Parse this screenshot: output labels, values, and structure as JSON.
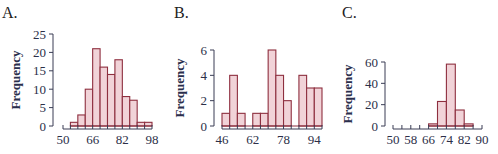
{
  "colors": {
    "bar_fill": "#f1d3d8",
    "bar_stroke": "#8e2f3f",
    "axis": "#3a3d55",
    "tick_text": "#2c2f48",
    "ylabel_text": "#2a2e4c"
  },
  "chart_data": [
    {
      "id": "A",
      "panel_label": "A.",
      "type": "bar",
      "subtype": "histogram",
      "title": "A.",
      "xlabel": "",
      "ylabel": "Frequency",
      "bin_width": 4,
      "bin_edges": [
        54,
        58,
        62,
        66,
        70,
        74,
        78,
        82,
        86,
        90,
        94,
        98
      ],
      "categories": [
        "54-58",
        "58-62",
        "62-66",
        "66-70",
        "70-74",
        "74-78",
        "78-82",
        "82-86",
        "86-90",
        "90-94",
        "94-98"
      ],
      "values": [
        1,
        3,
        10,
        21,
        16,
        14,
        18,
        8,
        7,
        1,
        1
      ],
      "xlim": [
        50,
        98
      ],
      "ylim": [
        0,
        25
      ],
      "xticks": [
        50,
        66,
        82,
        98
      ],
      "yticks": [
        0,
        5,
        10,
        15,
        20,
        25
      ],
      "grid": false,
      "geometry": {
        "x0px": 63,
        "x1px": 152,
        "y0px": 126,
        "y1px": 34,
        "yaxis_x": 53,
        "xaxis_y": 129,
        "ylabel_x": 20,
        "ylabel_y": 80,
        "title_x": 2,
        "title_y": 2
      }
    },
    {
      "id": "B",
      "panel_label": "B.",
      "type": "bar",
      "subtype": "histogram",
      "title": "B.",
      "xlabel": "",
      "ylabel": "Frequency",
      "bin_width": 4,
      "bin_edges": [
        46,
        50,
        54,
        58,
        62,
        66,
        70,
        74,
        78,
        82,
        86,
        90,
        94,
        98
      ],
      "categories": [
        "46-50",
        "50-54",
        "54-58",
        "58-62",
        "62-66",
        "66-70",
        "70-74",
        "74-78",
        "78-82",
        "82-86",
        "86-90",
        "90-94",
        "94-98"
      ],
      "values": [
        1,
        4,
        1,
        0,
        1,
        1,
        6,
        4,
        2,
        0,
        4,
        3,
        3
      ],
      "xlim": [
        46,
        98
      ],
      "ylim": [
        0,
        6
      ],
      "xticks": [
        46,
        62,
        78,
        94
      ],
      "yticks": [
        0,
        2,
        4,
        6
      ],
      "grid": false,
      "geometry": {
        "x0px": 222,
        "x1px": 322,
        "y0px": 126,
        "y1px": 50,
        "yaxis_x": 214,
        "xaxis_y": 129,
        "ylabel_x": 184,
        "ylabel_y": 88,
        "title_x": 174,
        "title_y": 2
      }
    },
    {
      "id": "C",
      "panel_label": "C.",
      "type": "bar",
      "subtype": "histogram",
      "title": "C.",
      "xlabel": "",
      "ylabel": "Frequency",
      "bin_width": 4,
      "bin_edges": [
        66,
        70,
        74,
        78,
        82,
        86
      ],
      "categories": [
        "66-70",
        "70-74",
        "74-78",
        "78-82",
        "82-86"
      ],
      "values": [
        2,
        23,
        58,
        15,
        2
      ],
      "xlim": [
        50,
        90
      ],
      "ylim": [
        0,
        60
      ],
      "xticks": [
        50,
        58,
        66,
        74,
        82,
        90
      ],
      "yticks": [
        0,
        20,
        40,
        60
      ],
      "grid": false,
      "geometry": {
        "x0px": 393,
        "x1px": 482,
        "y0px": 126,
        "y1px": 62,
        "yaxis_x": 385,
        "xaxis_y": 129,
        "ylabel_x": 352,
        "ylabel_y": 94,
        "title_x": 342,
        "title_y": 2
      }
    }
  ]
}
